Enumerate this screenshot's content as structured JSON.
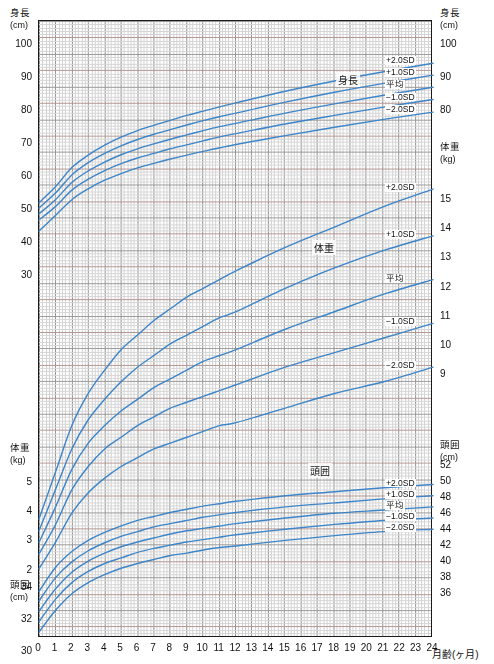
{
  "chart_data": {
    "type": "line",
    "xlabel": "月齢(ヶ月)",
    "xlim": [
      0,
      24
    ],
    "x_ticks": [
      "0",
      "1",
      "2",
      "3",
      "4",
      "5",
      "6",
      "7",
      "8",
      "9",
      "10",
      "11",
      "12",
      "13",
      "14",
      "15",
      "16",
      "17",
      "18",
      "19",
      "20",
      "21",
      "22",
      "23",
      "24"
    ],
    "grid": true,
    "legend_position": "inline-right",
    "colors": {
      "curve": "#3d85c8",
      "frame": "#1a1a1a",
      "grid_minor": "#c9c9c9",
      "grid_major": "#8a8a8a",
      "grid_red": "#e0b0a8"
    },
    "axes": [
      {
        "name": "height-left",
        "side": "left",
        "label": "身長",
        "unit": "(cm)",
        "ticks": [
          "100",
          "90",
          "80",
          "70",
          "60",
          "50",
          "40",
          "30"
        ],
        "range": [
          30,
          105
        ]
      },
      {
        "name": "height-right",
        "side": "right",
        "label": "身長",
        "unit": "(cm)",
        "ticks": [
          "100",
          "90",
          "80"
        ],
        "range": [
          80,
          105
        ]
      },
      {
        "name": "weight-left",
        "side": "left",
        "label": "体重",
        "unit": "(kg)",
        "ticks": [
          "5",
          "4",
          "3",
          "2"
        ],
        "range": [
          2,
          5
        ]
      },
      {
        "name": "weight-right",
        "side": "right",
        "label": "体重",
        "unit": "(kg)",
        "ticks": [
          "15",
          "14",
          "13",
          "12",
          "11",
          "10",
          "9"
        ],
        "range": [
          9,
          15
        ]
      },
      {
        "name": "head-left",
        "side": "left",
        "label": "頭囲",
        "unit": "(cm)",
        "ticks": [
          "34",
          "32",
          "30"
        ],
        "range": [
          30,
          34
        ]
      },
      {
        "name": "head-right",
        "side": "right",
        "label": "頭囲",
        "unit": "(cm)",
        "ticks": [
          "52",
          "50",
          "48",
          "46",
          "44",
          "42",
          "40",
          "38",
          "36"
        ],
        "range": [
          36,
          52
        ]
      }
    ],
    "series_groups": [
      {
        "name": "height",
        "label": "身長",
        "unit": "cm",
        "sd_labels": [
          "+2.0SD",
          "+1.0SD",
          "平均",
          "−1.0SD",
          "−2.0SD"
        ],
        "x": [
          0,
          1,
          2,
          3,
          4,
          5,
          6,
          7,
          8,
          9,
          10,
          11,
          12,
          15,
          18,
          21,
          24
        ],
        "series": [
          {
            "name": "+2.0SD",
            "values": [
              52.6,
              57.4,
              63.2,
              67.0,
              70.0,
              72.4,
              74.4,
              76.0,
              77.5,
              79.0,
              80.3,
              81.6,
              82.8,
              86.3,
              89.4,
              92.2,
              94.8
            ]
          },
          {
            "name": "+1.0SD",
            "values": [
              51.0,
              55.5,
              61.0,
              64.7,
              67.5,
              69.8,
              71.7,
              73.3,
              74.7,
              76.1,
              77.4,
              78.6,
              79.7,
              83.0,
              86.0,
              88.7,
              91.2
            ]
          },
          {
            "name": "平均",
            "values": [
              49.2,
              53.5,
              58.7,
              62.2,
              64.9,
              67.1,
              68.9,
              70.4,
              71.8,
              73.1,
              74.4,
              75.6,
              76.6,
              79.7,
              82.5,
              85.1,
              87.5
            ]
          },
          {
            "name": "−1.0SD",
            "values": [
              47.4,
              51.4,
              56.4,
              59.7,
              62.3,
              64.4,
              66.1,
              67.5,
              68.9,
              70.1,
              71.3,
              72.5,
              73.5,
              76.4,
              79.0,
              81.5,
              83.8
            ]
          },
          {
            "name": "−2.0SD",
            "values": [
              44.0,
              48.7,
              53.5,
              56.8,
              59.4,
              61.4,
              63.1,
              64.5,
              65.8,
              67.0,
              68.1,
              69.2,
              70.2,
              72.9,
              75.4,
              77.8,
              80.0
            ]
          }
        ]
      },
      {
        "name": "weight",
        "label": "体重",
        "unit": "kg",
        "sd_labels": [
          "+2.0SD",
          "+1.0SD",
          "平均",
          "−1.0SD",
          "−2.0SD"
        ],
        "x": [
          0,
          1,
          2,
          3,
          4,
          5,
          6,
          7,
          8,
          9,
          10,
          11,
          12,
          15,
          18,
          21,
          24
        ],
        "series": [
          {
            "name": "+2.0SD",
            "values": [
              3.8,
              5.4,
              7.0,
              8.1,
              8.9,
              9.6,
              10.1,
              10.6,
              11.0,
              11.4,
              11.7,
              12.0,
              12.3,
              13.1,
              13.8,
              14.5,
              15.1
            ]
          },
          {
            "name": "+1.0SD",
            "values": [
              3.4,
              4.8,
              6.2,
              7.2,
              7.9,
              8.5,
              9.0,
              9.4,
              9.8,
              10.1,
              10.4,
              10.7,
              10.9,
              11.7,
              12.4,
              13.0,
              13.5
            ]
          },
          {
            "name": "平均",
            "values": [
              3.0,
              4.2,
              5.5,
              6.4,
              7.0,
              7.5,
              7.9,
              8.3,
              8.6,
              8.9,
              9.2,
              9.4,
              9.6,
              10.3,
              10.9,
              11.5,
              12.0
            ]
          },
          {
            "name": "−1.0SD",
            "values": [
              2.6,
              3.6,
              4.8,
              5.6,
              6.2,
              6.6,
              7.0,
              7.3,
              7.6,
              7.8,
              8.0,
              8.2,
              8.4,
              9.0,
              9.5,
              10.0,
              10.5
            ]
          },
          {
            "name": "−2.0SD",
            "values": [
              2.1,
              3.0,
              4.0,
              4.7,
              5.2,
              5.6,
              5.9,
              6.2,
              6.4,
              6.6,
              6.8,
              7.0,
              7.1,
              7.6,
              8.1,
              8.5,
              9.0
            ]
          }
        ]
      },
      {
        "name": "head",
        "label": "頭囲",
        "unit": "cm",
        "sd_labels": [
          "+2.0SD",
          "+1.0SD",
          "平均",
          "−1.0SD",
          "−2.0SD"
        ],
        "x": [
          0,
          1,
          2,
          3,
          4,
          5,
          6,
          7,
          8,
          9,
          10,
          11,
          12,
          15,
          18,
          21,
          24
        ],
        "series": [
          {
            "name": "+2.0SD",
            "values": [
              36.4,
              39.4,
              41.4,
              42.8,
              43.8,
              44.6,
              45.3,
              45.8,
              46.3,
              46.7,
              47.1,
              47.4,
              47.7,
              48.4,
              48.9,
              49.4,
              49.8
            ]
          },
          {
            "name": "+1.0SD",
            "values": [
              35.2,
              38.1,
              40.1,
              41.5,
              42.5,
              43.3,
              43.9,
              44.5,
              44.9,
              45.3,
              45.7,
              46.0,
              46.3,
              47.0,
              47.5,
              48.0,
              48.4
            ]
          },
          {
            "name": "平均",
            "values": [
              33.9,
              36.7,
              38.8,
              40.2,
              41.2,
              42.0,
              42.6,
              43.1,
              43.6,
              44.0,
              44.3,
              44.6,
              44.9,
              45.6,
              46.2,
              46.6,
              47.0
            ]
          },
          {
            "name": "−1.0SD",
            "values": [
              32.6,
              35.4,
              37.5,
              38.9,
              39.9,
              40.6,
              41.3,
              41.8,
              42.2,
              42.6,
              42.9,
              43.2,
              43.5,
              44.2,
              44.8,
              45.3,
              45.6
            ]
          },
          {
            "name": "−2.0SD",
            "values": [
              31.3,
              34.0,
              36.1,
              37.5,
              38.5,
              39.3,
              39.9,
              40.4,
              40.9,
              41.2,
              41.6,
              41.9,
              42.1,
              42.8,
              43.4,
              43.9,
              44.2
            ]
          }
        ]
      }
    ]
  },
  "axis_titles": {
    "height_label": "身長",
    "height_unit": "(cm)",
    "weight_label": "体重",
    "weight_unit": "(kg)",
    "head_label": "頭囲",
    "head_unit": "(cm)",
    "x_title": "月齢(ヶ月)"
  },
  "left_ticks": {
    "height": [
      "100",
      "90",
      "80",
      "70",
      "60",
      "50",
      "40",
      "30"
    ],
    "weight": [
      "5",
      "4",
      "3",
      "2"
    ],
    "head": [
      "34",
      "32",
      "30"
    ]
  },
  "right_ticks": {
    "height": [
      "100",
      "90",
      "80"
    ],
    "weight": [
      "15",
      "14",
      "13",
      "12",
      "11",
      "10",
      "9"
    ],
    "head": [
      "52",
      "50",
      "48",
      "46",
      "44",
      "42",
      "40",
      "38",
      "36"
    ]
  },
  "sd": {
    "p2": "+2.0SD",
    "p1": "+1.0SD",
    "mean": "平均",
    "m1": "−1.0SD",
    "m2": "−2.0SD"
  },
  "series_names": {
    "height": "身長",
    "weight": "体重",
    "head": "頭囲"
  },
  "x_ticks": [
    "0",
    "1",
    "2",
    "3",
    "4",
    "5",
    "6",
    "7",
    "8",
    "9",
    "10",
    "11",
    "12",
    "13",
    "14",
    "15",
    "16",
    "17",
    "18",
    "19",
    "20",
    "21",
    "22",
    "23",
    "24"
  ]
}
